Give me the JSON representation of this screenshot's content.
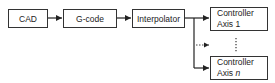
{
  "diagram": {
    "type": "block-flow",
    "nodes": [
      {
        "id": "cad",
        "label": "CAD"
      },
      {
        "id": "gcode",
        "label": "G-code"
      },
      {
        "id": "interp",
        "label": "Interpolator"
      },
      {
        "id": "ctrl1",
        "line1": "Controller",
        "line2_prefix": "Axis ",
        "line2_var": "1"
      },
      {
        "id": "ctrln",
        "line1": "Controller",
        "line2_prefix": "Axis ",
        "line2_var": "n"
      }
    ],
    "edges": [
      {
        "from": "cad",
        "to": "gcode"
      },
      {
        "from": "gcode",
        "to": "interp"
      },
      {
        "from": "interp",
        "to": "ctrl1"
      },
      {
        "from": "interp",
        "to": "intermediate-axes",
        "style": "dotted"
      },
      {
        "from": "interp",
        "to": "ctrln"
      }
    ],
    "ellipsis": "⋮"
  }
}
